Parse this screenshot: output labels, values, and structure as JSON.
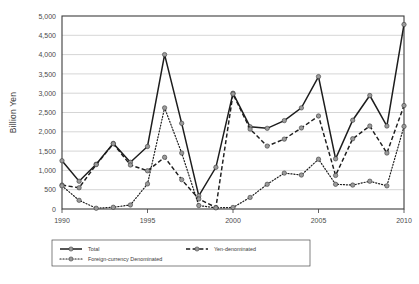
{
  "chart_data": {
    "type": "line",
    "title": "",
    "xlabel": "",
    "ylabel": "Billion Yen",
    "xlim": [
      1990,
      2010
    ],
    "ylim": [
      0,
      5000
    ],
    "ytick_step": 500,
    "xtick_step": 5,
    "grid": true,
    "legend_position": "bottom",
    "x": [
      1990,
      1991,
      1992,
      1993,
      1994,
      1995,
      1996,
      1997,
      1998,
      1999,
      2000,
      2001,
      2002,
      2003,
      2004,
      2005,
      2006,
      2007,
      2008,
      2009,
      2010
    ],
    "xtick_labels": [
      "1990",
      "1995",
      "2000",
      "2005",
      "2010"
    ],
    "ytick_labels": [
      "0",
      "500",
      "1,000",
      "1,500",
      "2,000",
      "2,500",
      "3,000",
      "3,500",
      "4,000",
      "4,500",
      "5,000"
    ],
    "series": [
      {
        "name": "Total",
        "style": "solid",
        "values": [
          1250,
          720,
          1160,
          1700,
          1210,
          1620,
          4000,
          2220,
          340,
          1080,
          3000,
          2130,
          2090,
          2290,
          2620,
          3430,
          1300,
          2300,
          2940,
          2150,
          4780
        ]
      },
      {
        "name": "Yen-denominated",
        "style": "dashed",
        "values": [
          620,
          550,
          1150,
          1690,
          1140,
          990,
          1340,
          760,
          260,
          40,
          2980,
          2070,
          1630,
          1810,
          2100,
          2410,
          870,
          1820,
          2150,
          1450,
          2680
        ]
      },
      {
        "name": "Foreign-currency Denominated",
        "style": "dotted",
        "values": [
          600,
          225,
          20,
          45,
          105,
          650,
          2620,
          1450,
          90,
          30,
          40,
          300,
          640,
          930,
          880,
          1290,
          640,
          620,
          720,
          600,
          2140
        ]
      }
    ]
  },
  "legend": {
    "items": [
      {
        "label": "Total",
        "style": "solid"
      },
      {
        "label": "Yen-denominated",
        "style": "dashed"
      },
      {
        "label": "Foreign-currency Denominated",
        "style": "dotted"
      }
    ]
  }
}
